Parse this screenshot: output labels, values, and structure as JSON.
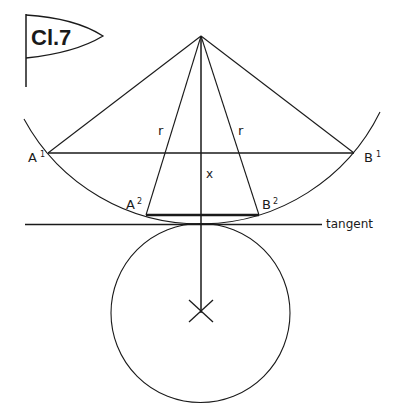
{
  "figure": {
    "plate_label": "Cl.7",
    "labels": {
      "a1": {
        "base": "A",
        "sup": "1"
      },
      "b1": {
        "base": "B",
        "sup": "1"
      },
      "a2": {
        "base": "A",
        "sup": "2"
      },
      "b2": {
        "base": "B",
        "sup": "2"
      },
      "r_left": "r",
      "r_right": "r",
      "x": "x",
      "tangent": "tangent"
    },
    "colors": {
      "ink": "#1a1a1a",
      "background": "#ffffff"
    }
  }
}
